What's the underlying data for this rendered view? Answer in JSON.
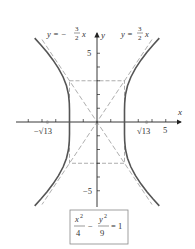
{
  "diagram": {
    "type": "hyperbola-graph",
    "equation": {
      "x_num": "x",
      "x_exp": "2",
      "x_den": "4",
      "minus": "−",
      "y_num": "y",
      "y_exp": "2",
      "y_den": "9",
      "equals": "= 1"
    },
    "asymptotes": [
      {
        "label_lhs": "y = −",
        "num": "3",
        "den": "2",
        "var": "x",
        "slope": -1.5
      },
      {
        "label_lhs": "y = ",
        "num": "3",
        "den": "2",
        "var": "x",
        "slope": 1.5
      }
    ],
    "axes": {
      "x_label": "x",
      "y_label": "y",
      "x_tick_5": "5",
      "y_tick_5": "5",
      "y_tick_neg5": "−5",
      "x_range": [
        -6,
        6
      ],
      "y_range": [
        -6,
        6
      ]
    },
    "foci": {
      "left_label": "−√13",
      "right_label": "√13",
      "value": 3.606
    },
    "vertices": [
      -2,
      2
    ],
    "box": {
      "a": 2,
      "b": 3
    },
    "colors": {
      "curve": "#555555",
      "dashed": "#999999",
      "axis": "#222222",
      "box_border": "#888888"
    }
  }
}
